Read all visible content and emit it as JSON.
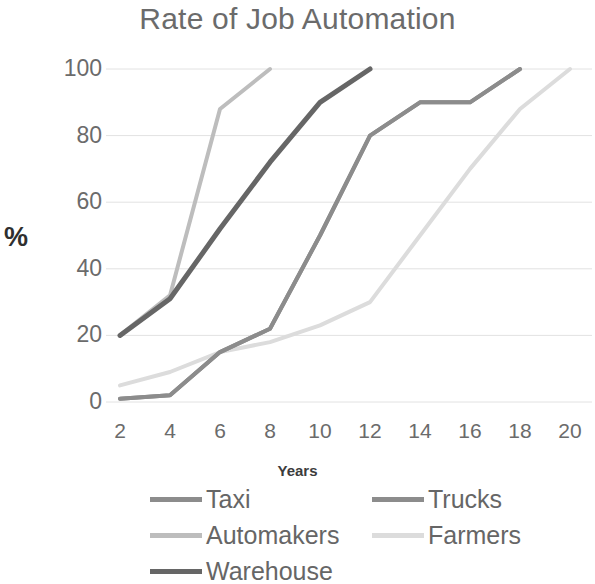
{
  "chart_data": {
    "type": "line",
    "title": "Rate of Job Automation",
    "xlabel": "Years",
    "ylabel": "%",
    "xlim": [
      2,
      20
    ],
    "ylim": [
      0,
      100
    ],
    "grid": true,
    "legend_position": "bottom",
    "x": [
      2,
      4,
      6,
      8,
      10,
      12,
      14,
      16,
      18,
      20
    ],
    "xticks": [
      "2",
      "4",
      "6",
      "8",
      "10",
      "12",
      "14",
      "16",
      "18",
      "20"
    ],
    "yticks": [
      "0",
      "20",
      "40",
      "60",
      "80",
      "100"
    ],
    "series": [
      {
        "name": "Taxi",
        "color": "#8c8c8c",
        "values": [
          1,
          2,
          15,
          22,
          50,
          80,
          90,
          90,
          100,
          100
        ]
      },
      {
        "name": "Trucks",
        "color": "#8c8c8c",
        "values": [
          1,
          2,
          15,
          22,
          50,
          80,
          90,
          90,
          100,
          100
        ]
      },
      {
        "name": "Automakers",
        "color": "#bdbdbd",
        "values": [
          20,
          32,
          88,
          100,
          100,
          100,
          100,
          100,
          100,
          100
        ]
      },
      {
        "name": "Farmers",
        "color": "#dcdcdc",
        "values": [
          5,
          9,
          15,
          18,
          23,
          30,
          50,
          70,
          88,
          100
        ]
      },
      {
        "name": "Warehouse",
        "color": "#666666",
        "values": [
          20,
          31,
          52,
          72,
          90,
          100,
          100,
          100,
          100,
          100
        ]
      }
    ]
  },
  "chart": {
    "title": "Rate of Job Automation",
    "x_axis_title": "Years",
    "y_axis_title": "%",
    "y_ticks": [
      "100",
      "80",
      "60",
      "40",
      "20",
      "0"
    ],
    "x_ticks": [
      "2",
      "4",
      "6",
      "8",
      "10",
      "12",
      "14",
      "16",
      "18",
      "20"
    ]
  },
  "legend": {
    "items": [
      {
        "label": "Taxi",
        "color": "#8c8c8c"
      },
      {
        "label": "Trucks",
        "color": "#8c8c8c"
      },
      {
        "label": "Automakers",
        "color": "#bdbdbd"
      },
      {
        "label": "Farmers",
        "color": "#dcdcdc"
      },
      {
        "label": "Warehouse",
        "color": "#666666"
      }
    ]
  }
}
